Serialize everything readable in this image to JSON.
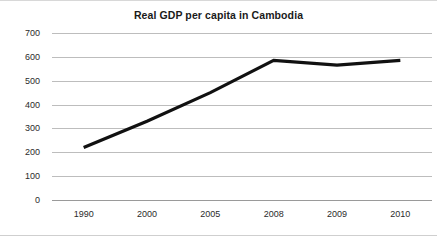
{
  "chart_data": {
    "type": "line",
    "title": "Real GDP per capita in Cambodia",
    "xlabel": "",
    "ylabel": "",
    "categories": [
      "1990",
      "2000",
      "2005",
      "2008",
      "2009",
      "2010"
    ],
    "values": [
      220,
      330,
      450,
      585,
      565,
      585
    ],
    "series": [
      {
        "name": "Real GDP per capita",
        "values": [
          220,
          330,
          450,
          585,
          565,
          585
        ]
      }
    ],
    "ylim": [
      0,
      700
    ],
    "ytick_labels": [
      "700",
      "600",
      "500",
      "400",
      "300",
      "200",
      "100",
      "0"
    ],
    "ytick_values": [
      700,
      600,
      500,
      400,
      300,
      200,
      100,
      0
    ],
    "grid": true,
    "legend": "none",
    "line_color": "#111111",
    "grid_color": "#bdbdbd",
    "background_color": "#ffffff"
  }
}
